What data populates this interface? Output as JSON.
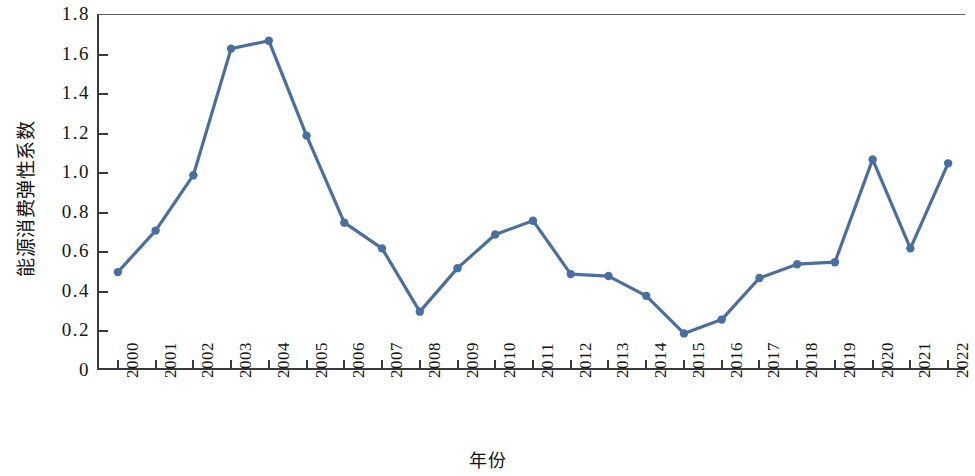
{
  "chart_data": {
    "type": "line",
    "title": "",
    "xlabel": "年份",
    "ylabel": "能源消费弹性系数",
    "categories": [
      "2000",
      "2001",
      "2002",
      "2003",
      "2004",
      "2005",
      "2006",
      "2007",
      "2008",
      "2009",
      "2010",
      "2011",
      "2012",
      "2013",
      "2014",
      "2015",
      "2016",
      "2017",
      "2018",
      "2019",
      "2020",
      "2021",
      "2022"
    ],
    "values": [
      0.5,
      0.71,
      0.99,
      1.63,
      1.67,
      1.19,
      0.75,
      0.62,
      0.3,
      0.52,
      0.69,
      0.76,
      0.49,
      0.48,
      0.38,
      0.19,
      0.26,
      0.47,
      0.54,
      0.55,
      1.07,
      0.62,
      1.05
    ],
    "series": [
      {
        "name": "能源消费弹性系数",
        "values": [
          0.5,
          0.71,
          0.99,
          1.63,
          1.67,
          1.19,
          0.75,
          0.62,
          0.3,
          0.52,
          0.69,
          0.76,
          0.49,
          0.48,
          0.38,
          0.19,
          0.26,
          0.47,
          0.54,
          0.55,
          1.07,
          0.62,
          1.05
        ]
      }
    ],
    "ylim": [
      0,
      1.8
    ],
    "y_ticks": [
      0,
      0.2,
      0.4,
      0.6,
      0.8,
      1.0,
      1.2,
      1.4,
      1.6,
      1.8
    ],
    "y_tick_labels": [
      "0",
      "0.2",
      "0.4",
      "0.6",
      "0.8",
      "1.0",
      "1.2",
      "1.4",
      "1.6",
      "1.8"
    ],
    "grid": false,
    "legend": null,
    "legend_position": "none",
    "line_color": "#4A6E9E",
    "marker_color": "#4A6E9E",
    "marker": "circle",
    "axis_color": "#3A3A3A",
    "background_color": "#FFFFFF",
    "x_tick_label_rotation": -90
  }
}
